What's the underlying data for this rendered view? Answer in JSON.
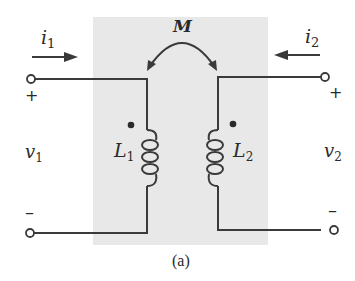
{
  "figure": {
    "caption": "(a)",
    "background_box_color": "#e8e8e8",
    "line_color": "#3a3a3a"
  },
  "mutual_inductance": {
    "label": "M"
  },
  "port1": {
    "current": {
      "symbol": "i",
      "subscript": "1",
      "direction": "right"
    },
    "voltage": {
      "symbol": "v",
      "subscript": "1"
    },
    "plus": "+",
    "minus": "–"
  },
  "port2": {
    "current": {
      "symbol": "i",
      "subscript": "2",
      "direction": "left"
    },
    "voltage": {
      "symbol": "v",
      "subscript": "2"
    },
    "plus": "+",
    "minus": "–"
  },
  "inductor1": {
    "symbol": "L",
    "subscript": "1",
    "dot": "top"
  },
  "inductor2": {
    "symbol": "L",
    "subscript": "2",
    "dot": "top"
  }
}
